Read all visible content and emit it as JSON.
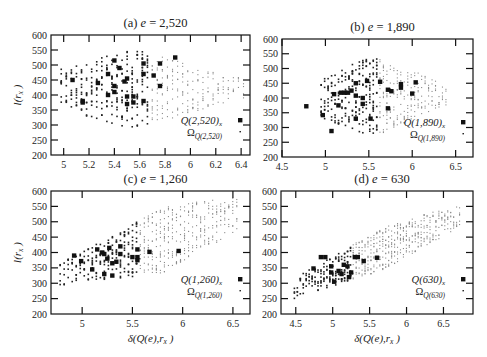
{
  "chart_data": [
    {
      "type": "scatter",
      "panel": "a",
      "title": "(a)  e = 2,520",
      "title_label": "(a)",
      "title_var": "e",
      "title_value": "= 2,520",
      "xlabel": "",
      "ylabel": "l(r_x)",
      "xlim": [
        4.9,
        6.47
      ],
      "ylim": [
        200,
        600
      ],
      "xticks": [
        5,
        5.2,
        5.4,
        5.6,
        5.8,
        6,
        6.2,
        6.4
      ],
      "yticks": [
        200,
        250,
        300,
        350,
        400,
        450,
        500,
        550,
        600
      ],
      "grid": false,
      "legend_position": "lower right (inside)",
      "frame_px": {
        "left": 51,
        "top": 35,
        "right": 250,
        "bottom": 155
      },
      "series": [
        {
          "name": "Q(2,520)_x",
          "marker": "large square",
          "points": [
            [
              5.07,
              450
            ],
            [
              5.15,
              380
            ],
            [
              5.15,
              375
            ],
            [
              5.27,
              440
            ],
            [
              5.35,
              470
            ],
            [
              5.35,
              400
            ],
            [
              5.4,
              515
            ],
            [
              5.4,
              430
            ],
            [
              5.4,
              410
            ],
            [
              5.44,
              490
            ],
            [
              5.48,
              445
            ],
            [
              5.5,
              455
            ],
            [
              5.5,
              395
            ],
            [
              5.5,
              370
            ],
            [
              5.55,
              395
            ],
            [
              5.55,
              375
            ],
            [
              5.63,
              505
            ],
            [
              5.63,
              470
            ],
            [
              5.63,
              380
            ],
            [
              5.71,
              465
            ],
            [
              5.76,
              505
            ],
            [
              5.76,
              430
            ],
            [
              5.88,
              525
            ]
          ]
        },
        {
          "name": "Ω_Q(2,520)",
          "marker": "small dot",
          "distribution": {
            "x_from": 4.98,
            "x_to": 6.42,
            "x_step": 0.04,
            "y_center": 420,
            "y_center_slope": 0,
            "half_span_peak": 135,
            "peak_x": 5.55,
            "half_span_edge": 40,
            "density_peak": 18,
            "dark_until_x": 5.7
          }
        }
      ]
    },
    {
      "type": "scatter",
      "panel": "b",
      "title": "(b)  e = 1,890",
      "title_label": "(b)",
      "title_var": "e",
      "title_value": "= 1,890",
      "xlabel": "",
      "ylabel": "",
      "xlim": [
        4.5,
        6.7
      ],
      "ylim": [
        200,
        600
      ],
      "xticks": [
        4.5,
        5,
        5.5,
        6,
        6.5
      ],
      "yticks": [
        200,
        250,
        300,
        350,
        400,
        450,
        500,
        550,
        600
      ],
      "grid": false,
      "legend_position": "lower right (inside)",
      "frame_px": {
        "left": 282,
        "top": 39,
        "right": 473,
        "bottom": 157
      },
      "series": [
        {
          "name": "Q(1,890)_x",
          "marker": "large square",
          "points": [
            [
              4.78,
              372
            ],
            [
              4.97,
              342
            ],
            [
              5.07,
              288
            ],
            [
              5.1,
              413
            ],
            [
              5.15,
              375
            ],
            [
              5.18,
              418
            ],
            [
              5.22,
              418
            ],
            [
              5.26,
              418
            ],
            [
              5.3,
              425
            ],
            [
              5.35,
              450
            ],
            [
              5.35,
              408
            ],
            [
              5.35,
              330
            ],
            [
              5.43,
              400
            ],
            [
              5.43,
              380
            ],
            [
              5.48,
              458
            ],
            [
              5.52,
              330
            ],
            [
              5.63,
              455
            ],
            [
              5.72,
              428
            ],
            [
              5.72,
              365
            ],
            [
              5.76,
              423
            ],
            [
              5.87,
              447
            ],
            [
              5.87,
              435
            ],
            [
              6.0,
              415
            ],
            [
              6.04,
              453
            ]
          ]
        },
        {
          "name": "Ω_Q(1,890)",
          "marker": "small dot",
          "distribution": {
            "x_from": 4.95,
            "x_to": 6.4,
            "x_step": 0.04,
            "y_center": 400,
            "y_center_slope": 10,
            "half_span_peak": 140,
            "peak_x": 5.55,
            "half_span_edge": 45,
            "density_peak": 18,
            "dark_until_x": 5.62
          }
        }
      ]
    },
    {
      "type": "scatter",
      "panel": "c",
      "title": "(c)  e = 1,260",
      "title_label": "(c)",
      "title_var": "e",
      "title_value": "= 1,260",
      "xlabel": "δ(Q(e),r_x)",
      "ylabel": "l(r_x)",
      "xlim": [
        4.69,
        6.67
      ],
      "ylim": [
        200,
        600
      ],
      "xticks": [
        5,
        5.5,
        6,
        6.5
      ],
      "yticks": [
        200,
        250,
        300,
        350,
        400,
        450,
        500,
        550,
        600
      ],
      "grid": false,
      "legend_position": "lower right (inside)",
      "frame_px": {
        "left": 51,
        "top": 191,
        "right": 250,
        "bottom": 314
      },
      "series": [
        {
          "name": "Q(1,260)_x",
          "marker": "large square",
          "points": [
            [
              4.92,
              390
            ],
            [
              4.99,
              372
            ],
            [
              5.1,
              345
            ],
            [
              5.15,
              410
            ],
            [
              5.2,
              400
            ],
            [
              5.22,
              395
            ],
            [
              5.22,
              330
            ],
            [
              5.25,
              380
            ],
            [
              5.27,
              415
            ],
            [
              5.3,
              365
            ],
            [
              5.3,
              325
            ],
            [
              5.34,
              370
            ],
            [
              5.38,
              420
            ],
            [
              5.38,
              395
            ],
            [
              5.5,
              385
            ],
            [
              5.55,
              410
            ],
            [
              5.55,
              385
            ],
            [
              5.55,
              375
            ],
            [
              5.67,
              402
            ],
            [
              5.96,
              405
            ]
          ]
        },
        {
          "name": "Ω_Q(1,260)",
          "marker": "small dot",
          "distribution": {
            "x_from": 4.78,
            "x_to": 6.55,
            "x_step": 0.04,
            "y_center": 330,
            "y_center_slope": 110,
            "half_span_peak": 110,
            "peak_x": 5.8,
            "half_span_edge": 40,
            "density_peak": 18,
            "dark_until_x": 5.56
          }
        }
      ]
    },
    {
      "type": "scatter",
      "panel": "d",
      "title": "(d)  e = 630",
      "title_label": "(d)",
      "title_var": "e",
      "title_value": "= 630",
      "xlabel": "δ(Q(e),r_x)",
      "ylabel": "",
      "xlim": [
        4.3,
        6.9
      ],
      "ylim": [
        200,
        600
      ],
      "xticks": [
        4.5,
        5,
        5.5,
        6,
        6.5
      ],
      "yticks": [
        200,
        250,
        300,
        350,
        400,
        450,
        500,
        550,
        600
      ],
      "grid": false,
      "legend_position": "lower right (inside)",
      "frame_px": {
        "left": 281,
        "top": 191,
        "right": 473,
        "bottom": 314
      },
      "series": [
        {
          "name": "Q(630)_x",
          "marker": "large square",
          "points": [
            [
              4.74,
              348
            ],
            [
              4.84,
              385
            ],
            [
              4.9,
              385
            ],
            [
              4.98,
              355
            ],
            [
              4.98,
              335
            ],
            [
              5.02,
              305
            ],
            [
              5.08,
              340
            ],
            [
              5.12,
              330
            ],
            [
              5.15,
              360
            ],
            [
              5.2,
              355
            ],
            [
              5.22,
              320
            ],
            [
              5.25,
              335
            ],
            [
              5.3,
              385
            ],
            [
              5.34,
              385
            ],
            [
              5.42,
              372
            ],
            [
              5.6,
              383
            ]
          ]
        },
        {
          "name": "Ω_Q(630)",
          "marker": "small dot",
          "distribution": {
            "x_from": 4.48,
            "x_to": 6.75,
            "x_step": 0.04,
            "y_center": 285,
            "y_center_slope": 105,
            "half_span_peak": 70,
            "peak_x": 5.7,
            "half_span_edge": 35,
            "density_peak": 16,
            "dark_until_x": 5.27
          }
        }
      ]
    }
  ],
  "legend_labels": {
    "a": {
      "q": "Q(2,520)",
      "q_sub": "x",
      "omega": "Ω",
      "omega_sub": "Q(2,520)"
    },
    "b": {
      "q": "Q(1,890)",
      "q_sub": "x",
      "omega": "Ω",
      "omega_sub": "Q(1,890)"
    },
    "c": {
      "q": "Q(1,260)",
      "q_sub": "x",
      "omega": "Ω",
      "omega_sub": "Q(1,260)"
    },
    "d": {
      "q": "Q(630)",
      "q_sub": "x",
      "omega": "Ω",
      "omega_sub": "Q(630)"
    }
  },
  "axis_labels": {
    "y_main": "l(r",
    "y_sub": "x",
    "y_close": ")",
    "x_main": "δ(Q(e),r",
    "x_sub": "x",
    "x_close": ")"
  }
}
